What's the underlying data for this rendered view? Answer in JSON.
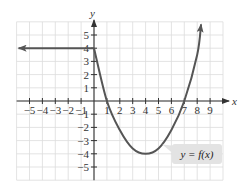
{
  "chart_data": {
    "type": "line",
    "title": "",
    "xlabel": "x",
    "ylabel": "y",
    "xlim": [
      -6,
      10
    ],
    "ylim": [
      -6,
      6
    ],
    "grid": true,
    "x_ticks": [
      -5,
      -4,
      -3,
      -2,
      -1,
      1,
      2,
      3,
      4,
      5,
      6,
      7,
      8,
      9
    ],
    "y_ticks": [
      -5,
      -4,
      -3,
      -2,
      -1,
      1,
      2,
      3,
      4,
      5
    ],
    "x_tick_labels": [
      "−5",
      "−4",
      "−3",
      "−2",
      "−1",
      "1",
      "2",
      "3",
      "4",
      "5",
      "6",
      "7",
      "8",
      "9"
    ],
    "y_tick_labels": [
      "−5",
      "−4",
      "−3",
      "−2",
      "−1",
      "1",
      "2",
      "3",
      "4",
      "5"
    ],
    "annotation": "y = f(x)",
    "series": [
      {
        "name": "y = f(x)",
        "description": "Horizontal ray y = 4 for x ≤ 0 (arrow pointing left), then a parabola-like curve through (0,4), (1,0), vertex (4,−4), (7,0), rising with an arrow upward past x ≈ 8.3",
        "points": [
          [
            -6,
            4
          ],
          [
            0,
            4
          ],
          [
            1,
            0
          ],
          [
            2,
            -2.2
          ],
          [
            3,
            -3.6
          ],
          [
            4,
            -4
          ],
          [
            5,
            -3.6
          ],
          [
            6,
            -2.2
          ],
          [
            7,
            0
          ],
          [
            8,
            3.5
          ],
          [
            8.3,
            5.8
          ]
        ]
      }
    ],
    "colors": {
      "curve": "#555555",
      "grid": "#dcdcdc",
      "axis": "#333333",
      "legend_bg": "#e3e3e3"
    }
  }
}
